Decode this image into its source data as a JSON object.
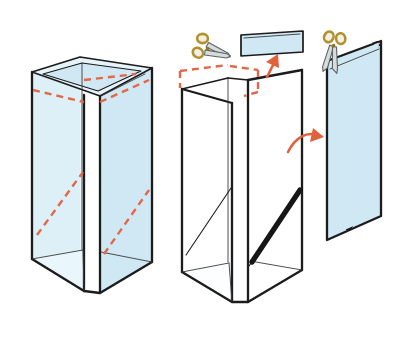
{
  "illustration": {
    "title": "Cutting a tall rectangular box into a flat panel",
    "type": "hand-drawn craft instruction diagram",
    "background_color": "#ffffff",
    "palette": {
      "paper_fill": "#d6ecf4",
      "paper_fill_light": "#e8f5fa",
      "paper_fill_pale": "#f2fafd",
      "ink": "#1b1b1b",
      "ink_soft": "#3a3a3a",
      "cut_dash": "#e2674a",
      "arrow": "#e2603a",
      "scissor_handle": "#c9a33a",
      "scissor_handle_fill": "#f3f0e2",
      "scissor_blade": "#d8dbdc",
      "scissor_blade_edge": "#5d6366",
      "dark_cut_edge": "#141414"
    },
    "steps": [
      {
        "id": "step-1",
        "name": "tall-box-with-cut-guides",
        "caption": "Tall open-top rectangular box with dashed cut guides around the top rim and along a diagonal",
        "marks": [
          "top-rim-dashed-line",
          "diagonal-dashed-line-left-face",
          "diagonal-dashed-line-right-face"
        ]
      },
      {
        "id": "step-2",
        "name": "box-with-top-strip-removed",
        "caption": "Box after the top strip is snipped away; diagonal cut opens the side",
        "marks": [
          "dashed-outline-of-removed-strip",
          "diagonal-open-cut",
          "dark-cut-edge"
        ]
      },
      {
        "id": "step-3",
        "name": "flat-panel-result",
        "caption": "Resulting flat angled panel after the final cut"
      }
    ],
    "pieces": [
      {
        "id": "cut-strip",
        "name": "removed-top-strip",
        "caption": "The narrow strip cut from the top of the box"
      }
    ],
    "tools": [
      {
        "id": "scissors-left",
        "name": "scissors-icon",
        "orientation": "horizontal",
        "caption": "Scissors cutting the top strip"
      },
      {
        "id": "scissors-right",
        "name": "scissors-icon",
        "orientation": "vertical",
        "caption": "Scissors cutting the panel free"
      }
    ],
    "arrows": [
      {
        "id": "arrow-to-strip",
        "name": "arrow-up-right-icon",
        "caption": "Strip lifts away from the box"
      },
      {
        "id": "arrow-to-panel",
        "name": "curved-arrow-right-icon",
        "caption": "Box side unfolds into flat panel"
      }
    ]
  }
}
